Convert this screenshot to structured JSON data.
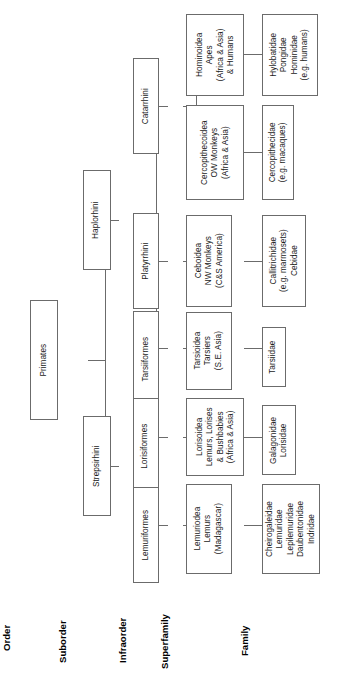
{
  "diagram": {
    "orientation": "rotated-90",
    "line_color": "#6b6b6b",
    "background": "#ffffff"
  },
  "ranks": [
    {
      "key": "order",
      "label": "Order"
    },
    {
      "key": "suborder",
      "label": "Suborder"
    },
    {
      "key": "infraorder",
      "label": "Infraorder"
    },
    {
      "key": "superfamily",
      "label": "Superfamily"
    },
    {
      "key": "family",
      "label": "Family"
    }
  ],
  "nodes": {
    "primates": {
      "lines": [
        "Primates"
      ]
    },
    "haplorhini": {
      "lines": [
        "Haplorhini"
      ]
    },
    "strepsirhini": {
      "lines": [
        "Strepsirhini"
      ]
    },
    "catarrhini": {
      "lines": [
        "Catarrhini"
      ]
    },
    "platyrrhini": {
      "lines": [
        "Platyrrhini"
      ]
    },
    "tarsiiformes": {
      "lines": [
        "Tarsiiformes"
      ]
    },
    "lorisiformes": {
      "lines": [
        "Lorisiformes"
      ]
    },
    "lemuriformes": {
      "lines": [
        "Lemuriformes"
      ]
    },
    "hominoidea": {
      "lines": [
        "Hominoidea",
        "Apes",
        "(Africa & Asia)",
        "& Humans"
      ]
    },
    "cercopithecoidea": {
      "lines": [
        "Cercopithecoidea",
        "OW Monkeys",
        "(Africa & Asia)"
      ]
    },
    "ceboidea": {
      "lines": [
        "Ceboidea",
        "NW Monkeys",
        "(C&S America)"
      ]
    },
    "tarsioidea": {
      "lines": [
        "Tarsioidea",
        "Tarsiers",
        "(S.E. Asia)"
      ]
    },
    "lorisoidea": {
      "lines": [
        "Lorisoidea",
        "Lemurs, Lorises",
        "& Bushbabies",
        "(Africa & Asia)"
      ]
    },
    "lemuriodea": {
      "lines": [
        "Lemuriodea",
        "Lemurs",
        "(Madagascar)"
      ]
    },
    "hominoidea_fam": {
      "lines": [
        "Hylobatidae",
        "Pongidae",
        "Hominidae",
        "(e.g. humans)"
      ]
    },
    "cercopithecidae": {
      "lines": [
        "Cercopithecidae",
        "(e.g. macaques)"
      ]
    },
    "ceboidea_fam": {
      "lines": [
        "Callitrichidae",
        "(e.g. marmosets)",
        "Cebidae"
      ]
    },
    "tarsiidae": {
      "lines": [
        "Tarsiidae"
      ]
    },
    "lorisoidea_fam": {
      "lines": [
        "Galagonidae",
        "Lorisidae"
      ]
    },
    "lemuriodea_fam": {
      "lines": [
        "Cheirogaleidae",
        "Lemuridae",
        "Lepilemuridae",
        "Daubentonidae",
        "Indridae"
      ]
    }
  },
  "tree": {
    "root": "primates",
    "edges": [
      {
        "from": "primates",
        "to": "haplorhini"
      },
      {
        "from": "primates",
        "to": "strepsirhini"
      },
      {
        "from": "haplorhini",
        "to": "catarrhini"
      },
      {
        "from": "haplorhini",
        "to": "platyrrhini"
      },
      {
        "from": "haplorhini",
        "to": "tarsiiformes"
      },
      {
        "from": "strepsirhini",
        "to": "lorisiformes"
      },
      {
        "from": "strepsirhini",
        "to": "lemuriformes"
      },
      {
        "from": "catarrhini",
        "to": "hominoidea"
      },
      {
        "from": "catarrhini",
        "to": "cercopithecoidea"
      },
      {
        "from": "platyrrhini",
        "to": "ceboidea"
      },
      {
        "from": "tarsiiformes",
        "to": "tarsioidea"
      },
      {
        "from": "lorisiformes",
        "to": "lorisoidea"
      },
      {
        "from": "lemuriformes",
        "to": "lemuriodea"
      },
      {
        "from": "hominoidea",
        "to": "hominoidea_fam"
      },
      {
        "from": "cercopithecoidea",
        "to": "cercopithecidae"
      },
      {
        "from": "ceboidea",
        "to": "ceboidea_fam"
      },
      {
        "from": "tarsioidea",
        "to": "tarsiidae"
      },
      {
        "from": "lorisoidea",
        "to": "lorisoidea_fam"
      },
      {
        "from": "lemuriodea",
        "to": "lemuriodea_fam"
      }
    ]
  }
}
